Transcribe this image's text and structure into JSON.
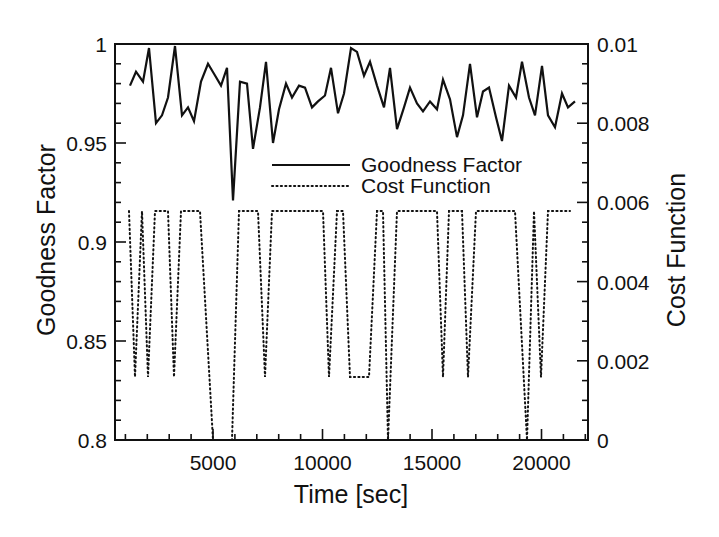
{
  "chart_data": {
    "type": "line",
    "title": "",
    "xlabel": "Time [sec]",
    "ylabel": "Goodness Factor",
    "y2label": "Cost Function",
    "xlim": [
      525,
      22123
    ],
    "ylim": [
      0.8,
      1.0
    ],
    "y2lim": [
      0,
      0.01
    ],
    "grid": false,
    "legend_position": "upper-center-inside",
    "x_ticks": [
      5000,
      10000,
      15000,
      20000
    ],
    "x_tick_labels": [
      "5000",
      "10000",
      "15000",
      "20000"
    ],
    "x_minor_step": 1000,
    "y_ticks": [
      0.8,
      0.85,
      0.9,
      0.95,
      1.0
    ],
    "y_tick_labels": [
      "0.8",
      "0.85",
      "0.9",
      "0.95",
      "1"
    ],
    "y_minor_step": 0.01,
    "y2_ticks": [
      0,
      0.002,
      0.004,
      0.006,
      0.008,
      0.01
    ],
    "y2_tick_labels": [
      "0",
      "0.002",
      "0.004",
      "0.006",
      "0.008",
      "0.01"
    ],
    "y2_minor_step": 0.0005,
    "series": [
      {
        "name": "Goodness Factor",
        "axis": "left",
        "style": "solid",
        "color": "#111111",
        "x": [
          1210,
          1484,
          1804,
          2078,
          2397,
          2671,
          2945,
          3265,
          3584,
          3858,
          4132,
          4452,
          4772,
          5046,
          5365,
          5639,
          5913,
          6233,
          6553,
          6826,
          7146,
          7420,
          7740,
          8014,
          8333,
          8607,
          8927,
          9201,
          9521,
          9795,
          10114,
          10388,
          10708,
          10982,
          11301,
          11575,
          11895,
          12169,
          12489,
          12808,
          13082,
          13402,
          13721,
          13995,
          14315,
          14589,
          14909,
          15228,
          15502,
          15822,
          16142,
          16416,
          16735,
          17055,
          17329,
          17603,
          17922,
          18196,
          18516,
          18836,
          19110,
          19429,
          19703,
          20023,
          20297,
          20616,
          20936,
          21210,
          21530
        ],
        "values": [
          0.979,
          0.986,
          0.981,
          0.998,
          0.96,
          0.964,
          0.973,
          0.999,
          0.964,
          0.968,
          0.961,
          0.981,
          0.99,
          0.985,
          0.979,
          0.988,
          0.921,
          0.981,
          0.98,
          0.947,
          0.968,
          0.991,
          0.95,
          0.967,
          0.98,
          0.973,
          0.979,
          0.978,
          0.968,
          0.971,
          0.974,
          0.988,
          0.965,
          0.975,
          0.998,
          0.996,
          0.984,
          0.991,
          0.979,
          0.968,
          0.988,
          0.957,
          0.968,
          0.978,
          0.97,
          0.966,
          0.971,
          0.967,
          0.982,
          0.972,
          0.953,
          0.964,
          0.99,
          0.963,
          0.976,
          0.978,
          0.963,
          0.951,
          0.979,
          0.973,
          0.991,
          0.973,
          0.964,
          0.989,
          0.964,
          0.958,
          0.975,
          0.968,
          0.971
        ]
      },
      {
        "name": "Cost Function",
        "axis": "right",
        "style": "dotted",
        "color": "#111111",
        "x": [
          1164,
          1438,
          1758,
          2032,
          2352,
          2945,
          3219,
          3539,
          4406,
          5000,
          5868,
          6187,
          7055,
          7374,
          7694,
          10023,
          10297,
          10662,
          10936,
          11256,
          12123,
          12489,
          12763,
          12991,
          13402,
          15228,
          15502,
          15776,
          16370,
          16644,
          17009,
          18790,
          19338,
          19658,
          19977,
          20297,
          21301
        ],
        "values": [
          0.00578,
          0.00159,
          0.00578,
          0.00159,
          0.00578,
          0.00578,
          0.00159,
          0.00578,
          0.00578,
          0,
          0,
          0.00578,
          0.00578,
          0.00159,
          0.00578,
          0.00578,
          0.00159,
          0.00578,
          0.00578,
          0.00159,
          0.00159,
          0.00578,
          0.00578,
          0,
          0.00578,
          0.00578,
          0.00159,
          0.00578,
          0.00578,
          0.00159,
          0.00578,
          0.00578,
          0,
          0.00578,
          0.00159,
          0.00578,
          0.00578
        ]
      }
    ]
  },
  "legend": {
    "items": [
      {
        "label": "Goodness Factor",
        "style": "solid"
      },
      {
        "label": "Cost Function",
        "style": "dotted"
      }
    ]
  },
  "colors": {
    "ink": "#111111",
    "background": "#ffffff"
  }
}
